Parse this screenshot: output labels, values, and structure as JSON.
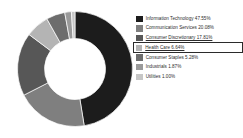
{
  "chart_data": {
    "type": "pie",
    "variant": "donut",
    "title": "",
    "subtitle": "",
    "xlabel": "",
    "ylabel": "",
    "legend_position": "right",
    "grid": false,
    "value_unit": "%",
    "start_angle_deg": 0,
    "direction": "clockwise",
    "categories": [
      "Information Technology",
      "Communication Services",
      "Consumer Discretionary",
      "Health Care",
      "Consumer Staples",
      "Industrials",
      "Utilities"
    ],
    "values": [
      47.55,
      20.08,
      17.81,
      6.64,
      5.28,
      1.87,
      1.0
    ],
    "value_labels": [
      "47.55%",
      "20.08%",
      "17.81%",
      "6.64%",
      "5.28%",
      "1.87%",
      "1.00%"
    ],
    "colors": [
      "#1c1c1c",
      "#7f7f7f",
      "#575757",
      "#b4b4b4",
      "#6d6d6d",
      "#9a9a9a",
      "#c6c6c6"
    ],
    "total": 100.23
  },
  "legend": {
    "items": [
      {
        "label": "Information Technology",
        "value_label": "47.55%",
        "text": "Information Technology 47.55%",
        "color": "#1c1c1c",
        "underlined": false,
        "highlighted": false
      },
      {
        "label": "Communication Services",
        "value_label": "20.08%",
        "text": "Communication Services 20.08%",
        "color": "#7f7f7f",
        "underlined": false,
        "highlighted": false
      },
      {
        "label": "Consumer Discretionary",
        "value_label": "17.81%",
        "text": "Consumer Discretionary 17.81%",
        "color": "#575757",
        "underlined": true,
        "highlighted": false
      },
      {
        "label": "Health Care",
        "value_label": "6.64%",
        "text": "Health Care 6.64%",
        "color": "#b4b4b4",
        "underlined": true,
        "highlighted": true
      },
      {
        "label": "Consumer Staples",
        "value_label": "5.28%",
        "text": "Consumer Staples 5.28%",
        "color": "#6d6d6d",
        "underlined": false,
        "highlighted": false
      },
      {
        "label": "Industrials",
        "value_label": "1.87%",
        "text": "Industrials 1.87%",
        "color": "#9a9a9a",
        "underlined": false,
        "highlighted": false
      },
      {
        "label": "Utilities",
        "value_label": "1.00%",
        "text": "Utilities 1.00%",
        "color": "#c6c6c6",
        "underlined": false,
        "highlighted": false
      }
    ]
  },
  "style": {
    "background": "#ffffff",
    "highlight_border": "#2b2b2b",
    "text_color": "#2d2d2d"
  }
}
